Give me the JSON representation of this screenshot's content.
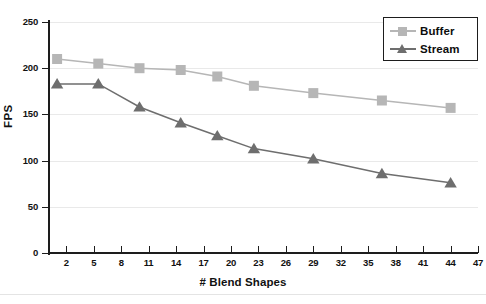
{
  "chart_data": {
    "type": "line",
    "title": "",
    "xlabel": "# Blend Shapes",
    "ylabel": "FPS",
    "xlim": [
      0,
      47
    ],
    "ylim": [
      0,
      250
    ],
    "xtick_labels": [
      "2",
      "5",
      "8",
      "11",
      "14",
      "17",
      "20",
      "23",
      "26",
      "29",
      "32",
      "35",
      "38",
      "41",
      "44",
      "47"
    ],
    "xticks": [
      2,
      5,
      8,
      11,
      14,
      17,
      20,
      23,
      26,
      29,
      32,
      35,
      38,
      41,
      44,
      47
    ],
    "ytick_labels": [
      "0",
      "50",
      "100",
      "150",
      "200",
      "250"
    ],
    "yticks": [
      0,
      50,
      100,
      150,
      200,
      250
    ],
    "grid": "horizontal",
    "legend_position": "top-right",
    "series": [
      {
        "name": "Buffer",
        "marker": "square",
        "color": "#b6b6b6",
        "x": [
          1,
          5.5,
          10,
          14.5,
          18.5,
          22.5,
          29,
          36.5,
          44
        ],
        "values": [
          210,
          205,
          200,
          198,
          191,
          181,
          173,
          165,
          157
        ]
      },
      {
        "name": "Stream",
        "marker": "triangle",
        "color": "#6e6e6e",
        "x": [
          1,
          5.5,
          10,
          14.5,
          18.5,
          22.5,
          29,
          36.5,
          44
        ],
        "values": [
          183,
          183,
          158,
          141,
          127,
          113,
          102,
          86,
          76
        ]
      }
    ]
  },
  "legend": {
    "entries": [
      {
        "label": "Buffer"
      },
      {
        "label": "Stream"
      }
    ]
  },
  "colors": {
    "buffer": "#b6b6b6",
    "stream": "#6e6e6e",
    "axis": "#1d1d1d",
    "grid": "#e9e9e9",
    "background": "#ffffff"
  }
}
